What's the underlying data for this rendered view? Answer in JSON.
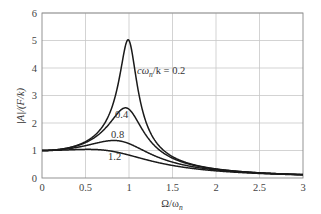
{
  "chart_data": {
    "type": "line",
    "title": "",
    "xlabel": "Ω/ω_n",
    "ylabel": "|A|/(F/k)",
    "xlim": [
      0,
      3
    ],
    "ylim": [
      0,
      6
    ],
    "grid": true,
    "xticks": [
      "0",
      "0.5",
      "1",
      "1.5",
      "2",
      "2.5",
      "3"
    ],
    "yticks": [
      "0",
      "1",
      "2",
      "3",
      "4",
      "5",
      "6"
    ],
    "formula": "|A|/(F/k) = 1 / sqrt((1 - r^2)^2 + (ζ r)^2), r = Ω/ω_n, ζ = cω_n/k",
    "x": [
      0,
      0.25,
      0.5,
      0.7,
      0.8,
      0.9,
      0.95,
      1.0,
      1.05,
      1.1,
      1.2,
      1.5,
      2.0,
      2.5,
      3.0
    ],
    "series": [
      {
        "name": "cω_n/k = 0.2",
        "param": 0.2,
        "values": [
          1.0,
          1.06,
          1.32,
          1.88,
          2.59,
          3.91,
          4.7,
          5.0,
          4.64,
          3.73,
          2.31,
          0.78,
          0.33,
          0.19,
          0.12
        ]
      },
      {
        "name": "0.4",
        "param": 0.4,
        "values": [
          1.0,
          1.06,
          1.31,
          1.79,
          2.21,
          2.41,
          2.45,
          2.5,
          2.32,
          2.06,
          1.55,
          0.72,
          0.33,
          0.19,
          0.12
        ]
      },
      {
        "name": "0.8",
        "param": 0.8,
        "values": [
          1.0,
          1.06,
          1.26,
          1.38,
          1.4,
          1.35,
          1.29,
          1.25,
          1.18,
          1.08,
          0.9,
          0.62,
          0.31,
          0.18,
          0.12
        ]
      },
      {
        "name": "1.2",
        "param": 1.2,
        "values": [
          1.0,
          1.04,
          1.09,
          1.05,
          0.99,
          0.92,
          0.87,
          0.83,
          0.79,
          0.75,
          0.67,
          0.48,
          0.28,
          0.18,
          0.12
        ]
      }
    ],
    "annotations": [
      {
        "text": "cω_n/k = 0.2",
        "x": 1.05,
        "y": 4.2
      },
      {
        "text": "0.4",
        "x": 0.78,
        "y": 2.25
      },
      {
        "text": "0.8",
        "x": 0.78,
        "y": 1.6
      },
      {
        "text": "1.2",
        "x": 0.78,
        "y": 0.75
      }
    ]
  },
  "labels": {
    "ylabel": "|A|/(F/k)",
    "xlabel_main": "Ω/ω",
    "xlabel_sub": "n",
    "ann_main": "cω",
    "ann_sub": "n",
    "ann_rest": "/k = 0.2",
    "ann_04": "0.4",
    "ann_08": "0.8",
    "ann_12": "1.2"
  }
}
